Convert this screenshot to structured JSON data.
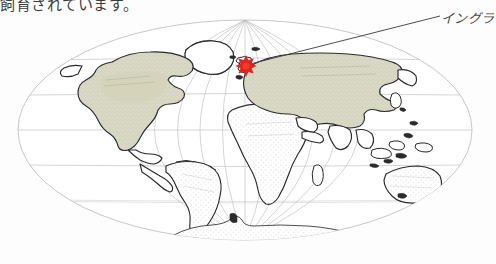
{
  "page": {
    "background_color": "#fdfdfd",
    "width": 496,
    "height": 264
  },
  "body_text": {
    "line": "飼育されています。"
  },
  "annotation": {
    "label": "イングラ",
    "label_full_hint": "イングラ",
    "leader_from": {
      "x": 250,
      "y": 64
    },
    "leader_to": {
      "x": 438,
      "y": 16
    },
    "marker": {
      "name": "england-marker",
      "color": "#e0241f",
      "x": 246,
      "y": 62
    }
  },
  "map": {
    "title": "",
    "projection": "Mollweide",
    "style": "hand-drawn pen sketch",
    "ellipse": {
      "center_x": 245,
      "center_y": 130,
      "radius_x": 227,
      "radius_y": 110
    },
    "graticule": {
      "meridian_count": 11,
      "parallel_count": 5,
      "stroke_color": "#b9b9bd",
      "tint_green": "#cfe6cf",
      "tint_magenta": "#e9d3ea"
    },
    "land_colors": {
      "outline": "#2a2a2a",
      "fill": "#ffffff",
      "tinted_fill": "#d9d8c4"
    },
    "landmasses": [
      {
        "name": "north-america",
        "tinted": true
      },
      {
        "name": "south-america",
        "tinted": false
      },
      {
        "name": "greenland",
        "tinted": false
      },
      {
        "name": "africa",
        "tinted": false
      },
      {
        "name": "eurasia",
        "tinted": true
      },
      {
        "name": "india",
        "tinted": false
      },
      {
        "name": "southeast-asia-islands",
        "tinted": false
      },
      {
        "name": "australia",
        "tinted": false
      },
      {
        "name": "new-zealand",
        "tinted": false
      },
      {
        "name": "japan",
        "tinted": false
      },
      {
        "name": "madagascar",
        "tinted": false
      },
      {
        "name": "antarctica",
        "tinted": false
      },
      {
        "name": "british-isles",
        "tinted": false
      }
    ]
  }
}
